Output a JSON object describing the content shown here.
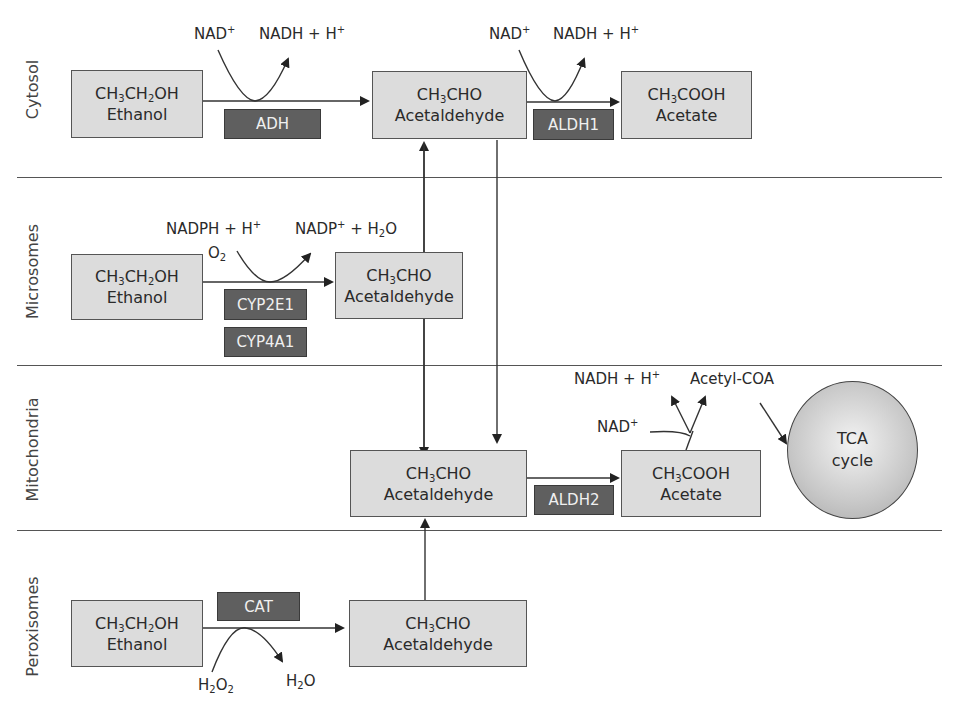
{
  "regions": {
    "cytosol": "Cytosol",
    "microsomes": "Microsomes",
    "mitochondria": "Mitochondria",
    "peroxisomes": "Peroxisomes"
  },
  "compounds": {
    "ethanol_formula_parts": [
      "CH",
      "3",
      "CH",
      "2",
      "OH"
    ],
    "ethanol_name": "Ethanol",
    "acetaldehyde_formula_parts": [
      "CH",
      "3",
      "CHO"
    ],
    "acetaldehyde_name": "Acetaldehyde",
    "acetate_formula_parts": [
      "CH",
      "3",
      "COOH"
    ],
    "acetate_name": "Acetate"
  },
  "enzymes": {
    "adh": "ADH",
    "aldh1": "ALDH1",
    "cyp2e1": "CYP2E1",
    "cyp4a1": "CYP4A1",
    "aldh2": "ALDH2",
    "cat": "CAT"
  },
  "cofactors": {
    "nad": "NAD",
    "plus": "+",
    "nadh_h": "NADH + H",
    "nadph_h": "NADPH + H",
    "nadp": "NADP",
    "plus_h2o_prefix": " + H",
    "h2o_suffix": "O",
    "o": "O",
    "o2_sub": "2",
    "h": "H",
    "two": "2",
    "acetyl_coa": "Acetyl-COA"
  },
  "tca": {
    "line1": "TCA",
    "line2": "cycle"
  },
  "colors": {
    "box_fill": "#dcdcdc",
    "enzyme_fill": "#5f5f5f",
    "line": "#555555"
  }
}
